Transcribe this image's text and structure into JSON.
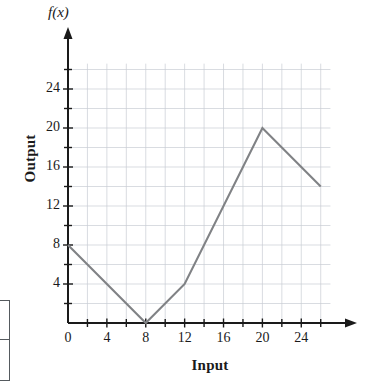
{
  "chart_data": {
    "type": "line",
    "title": "",
    "subtitle": "",
    "xlabel": "Input",
    "ylabel": "Output",
    "y_axis_symbol": "f(x)",
    "grid": true,
    "grid_step": 2,
    "legend": null,
    "xlim": [
      0,
      28
    ],
    "ylim": [
      0,
      27
    ],
    "x_ticks_major": [
      0,
      4,
      8,
      12,
      16,
      20,
      24
    ],
    "y_ticks_major": [
      4,
      8,
      12,
      16,
      20,
      24
    ],
    "x_ticks_minor": [
      2,
      6,
      10,
      14,
      18,
      22,
      26
    ],
    "y_ticks_minor": [
      2,
      6,
      10,
      14,
      18,
      22,
      26
    ],
    "x_tick_labels": [
      "0",
      "4",
      "8",
      "12",
      "16",
      "20",
      "24"
    ],
    "y_tick_labels": [
      "4",
      "8",
      "12",
      "16",
      "20",
      "24"
    ],
    "series": [
      {
        "name": "f(x)",
        "color": "#808285",
        "points": [
          {
            "x": 0,
            "y": 8
          },
          {
            "x": 8,
            "y": 0
          },
          {
            "x": 12,
            "y": 4
          },
          {
            "x": 20,
            "y": 20
          },
          {
            "x": 26,
            "y": 14
          }
        ]
      }
    ],
    "axis_arrows": {
      "x": "right",
      "y": "up"
    },
    "colors": {
      "line": "#808285",
      "grid": "#c8cdd4",
      "axis": "#1a1a1a",
      "text": "#1a1a1a"
    }
  }
}
